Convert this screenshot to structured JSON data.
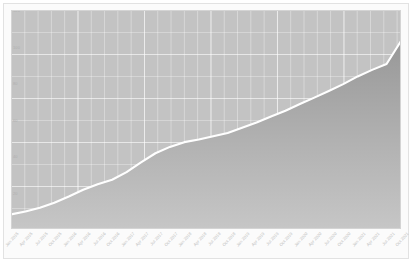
{
  "figure": {
    "background_color": "#fbfbfb",
    "plot_background_color": "#c3c3c3",
    "line_color": "#ffffff",
    "fill_top_color": "#9a9a9a",
    "fill_bottom_color": "#c6c6c6",
    "grid_color": "#d8d8d8",
    "axis_label_color": "#bdbdbd"
  },
  "chart_data": {
    "type": "area",
    "title": "",
    "subtitle": "",
    "xlabel": "",
    "ylabel": "",
    "grid": true,
    "legend": false,
    "legend_position": "none",
    "xlim": [
      0,
      27
    ],
    "ylim": [
      0,
      120
    ],
    "ytick_labels": [
      "120",
      "100",
      "80",
      "60",
      "40",
      "20"
    ],
    "ytick_values": [
      120,
      100,
      80,
      60,
      40,
      20
    ],
    "categories": [
      "Jan 2015",
      "Apr 2015",
      "Jul 2015",
      "Oct 2015",
      "Jan 2016",
      "Apr 2016",
      "Jul 2016",
      "Oct 2016",
      "Jan 2017",
      "Apr 2017",
      "Jul 2017",
      "Oct 2017",
      "Jan 2018",
      "Apr 2018",
      "Jul 2018",
      "Oct 2018",
      "Jan 2019",
      "Apr 2019",
      "Jul 2019",
      "Oct 2019",
      "Jan 2020",
      "Apr 2020",
      "Jul 2020",
      "Oct 2020",
      "Jan 2021",
      "Apr 2021",
      "Jul 2021",
      "Oct 2021"
    ],
    "series": [
      {
        "name": "Series 1",
        "color": "#ffffff",
        "values": [
          8.0,
          9.6,
          11.6,
          14.4,
          17.8,
          21.5,
          24.5,
          27.0,
          31.2,
          36.5,
          41.5,
          45.0,
          47.6,
          49.0,
          50.8,
          52.6,
          55.5,
          58.4,
          61.6,
          64.8,
          68.5,
          72.0,
          75.6,
          79.4,
          83.6,
          87.2,
          90.4,
          103.0
        ]
      }
    ]
  }
}
